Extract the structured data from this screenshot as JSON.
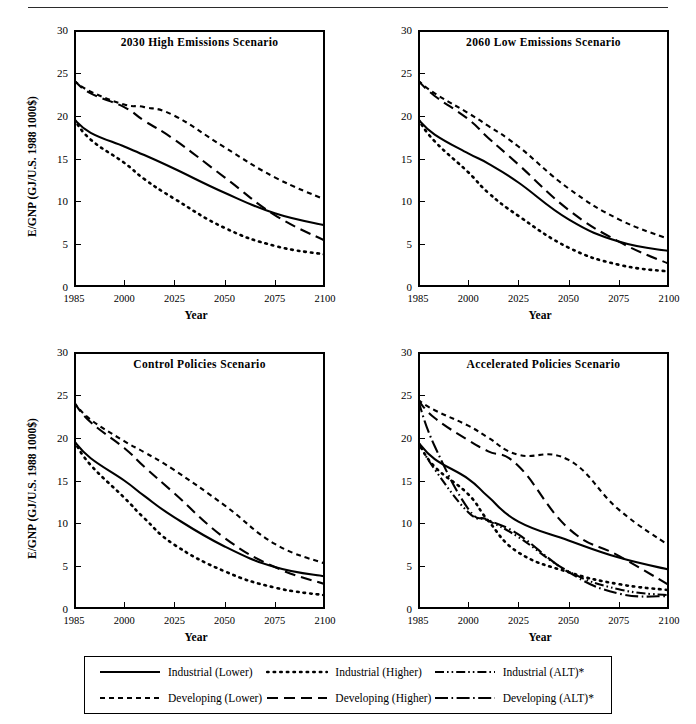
{
  "figure": {
    "header_rule": true,
    "axis": {
      "ylabel": "E/GNP (GJ/U.S. 1988 1000$)",
      "xlabel": "Year",
      "yticks": [
        "30",
        "25",
        "20",
        "15",
        "10",
        "5",
        "0"
      ],
      "xticks": [
        "1985",
        "2000",
        "2025",
        "2050",
        "2075",
        "2100"
      ]
    },
    "legend": {
      "items": [
        {
          "label": "Industrial (Lower)",
          "style": "solid"
        },
        {
          "label": "Industrial (Higher)",
          "style": "dotted"
        },
        {
          "label": "Industrial (ALT)*",
          "style": "dashdotdot"
        },
        {
          "label": "Developing (Lower)",
          "style": "shortdash"
        },
        {
          "label": "Developing (Higher)",
          "style": "longdash"
        },
        {
          "label": "Developing (ALT)*",
          "style": "dashdot"
        }
      ]
    }
  },
  "chart_data": [
    {
      "type": "line",
      "title": "2030 High Emissions Scenario",
      "xlabel": "Year",
      "ylabel": "E/GNP (GJ/U.S. 1988 1000$)",
      "xticks": [
        1985,
        2000,
        2025,
        2050,
        2075,
        2100
      ],
      "ylim": [
        0,
        30
      ],
      "xlim": [
        1985,
        2100
      ],
      "grid": false,
      "series": [
        {
          "name": "Industrial (Lower)",
          "style": "solid",
          "x": [
            1985,
            1990,
            2000,
            2010,
            2025,
            2050,
            2075,
            2100
          ],
          "values": [
            19.6,
            18.0,
            16.4,
            15.4,
            13.8,
            11.0,
            8.6,
            7.2
          ]
        },
        {
          "name": "Industrial (Higher)",
          "style": "dotted",
          "x": [
            1985,
            1990,
            2000,
            2010,
            2025,
            2050,
            2075,
            2100
          ],
          "values": [
            19.6,
            17.2,
            14.5,
            12.6,
            10.3,
            6.9,
            4.8,
            3.8
          ]
        },
        {
          "name": "Developing (Lower)",
          "style": "shortdash",
          "x": [
            1985,
            1990,
            2000,
            2010,
            2025,
            2050,
            2075,
            2100
          ],
          "values": [
            24.1,
            22.8,
            21.3,
            21.0,
            20.0,
            16.3,
            12.8,
            10.2
          ]
        },
        {
          "name": "Developing (Higher)",
          "style": "longdash",
          "x": [
            1985,
            1990,
            2000,
            2010,
            2025,
            2050,
            2075,
            2100
          ],
          "values": [
            24.1,
            22.6,
            21.0,
            19.4,
            17.2,
            12.8,
            8.4,
            5.4
          ]
        }
      ]
    },
    {
      "type": "line",
      "title": "2060 Low Emissions Scenario",
      "xlabel": "Year",
      "ylabel": "E/GNP (GJ/U.S. 1988 1000$)",
      "xticks": [
        1985,
        2000,
        2025,
        2050,
        2075,
        2100
      ],
      "ylim": [
        0,
        30
      ],
      "xlim": [
        1985,
        2100
      ],
      "grid": false,
      "series": [
        {
          "name": "Industrial (Lower)",
          "style": "solid",
          "x": [
            1985,
            1990,
            2000,
            2010,
            2025,
            2050,
            2075,
            2100
          ],
          "values": [
            19.6,
            17.8,
            15.6,
            14.4,
            12.2,
            7.9,
            5.3,
            4.2
          ]
        },
        {
          "name": "Industrial (Higher)",
          "style": "dotted",
          "x": [
            1985,
            1990,
            2000,
            2010,
            2025,
            2050,
            2075,
            2100
          ],
          "values": [
            19.6,
            17.0,
            13.4,
            11.0,
            8.3,
            4.6,
            2.6,
            1.8
          ]
        },
        {
          "name": "Developing (Lower)",
          "style": "shortdash",
          "x": [
            1985,
            1990,
            2000,
            2010,
            2025,
            2050,
            2075,
            2100
          ],
          "values": [
            24.1,
            22.6,
            20.3,
            18.8,
            16.4,
            11.5,
            7.9,
            5.6
          ]
        },
        {
          "name": "Developing (Higher)",
          "style": "longdash",
          "x": [
            1985,
            1990,
            2000,
            2010,
            2025,
            2050,
            2075,
            2100
          ],
          "values": [
            24.1,
            22.3,
            19.6,
            17.4,
            14.3,
            9.0,
            5.3,
            2.7
          ]
        }
      ]
    },
    {
      "type": "line",
      "title": "Control Policies Scenario",
      "xlabel": "Year",
      "ylabel": "E/GNP (GJ/U.S. 1988 1000$)",
      "xticks": [
        1985,
        2000,
        2025,
        2050,
        2075,
        2100
      ],
      "ylim": [
        0,
        30
      ],
      "xlim": [
        1985,
        2100
      ],
      "grid": false,
      "series": [
        {
          "name": "Industrial (Lower)",
          "style": "solid",
          "x": [
            1985,
            1990,
            2000,
            2010,
            2025,
            2050,
            2075,
            2100
          ],
          "values": [
            19.6,
            17.6,
            15.0,
            13.2,
            10.7,
            7.3,
            4.9,
            3.8
          ]
        },
        {
          "name": "Industrial (Higher)",
          "style": "dotted",
          "x": [
            1985,
            1990,
            2000,
            2010,
            2025,
            2050,
            2075,
            2100
          ],
          "values": [
            19.6,
            16.8,
            13.0,
            10.6,
            7.5,
            4.4,
            2.5,
            1.6
          ]
        },
        {
          "name": "Developing (Lower)",
          "style": "shortdash",
          "x": [
            1985,
            1990,
            2000,
            2010,
            2025,
            2050,
            2075,
            2100
          ],
          "values": [
            24.1,
            22.1,
            19.6,
            18.3,
            16.2,
            12.1,
            7.6,
            5.3
          ]
        },
        {
          "name": "Developing (Higher)",
          "style": "longdash",
          "x": [
            1985,
            1990,
            2000,
            2010,
            2025,
            2050,
            2075,
            2100
          ],
          "values": [
            24.1,
            21.8,
            18.8,
            16.6,
            13.5,
            8.3,
            4.9,
            2.9
          ]
        }
      ]
    },
    {
      "type": "line",
      "title": "Accelerated Policies Scenario",
      "xlabel": "Year",
      "ylabel": "E/GNP (GJ/U.S. 1988 1000$)",
      "xticks": [
        1985,
        2000,
        2025,
        2050,
        2075,
        2100
      ],
      "ylim": [
        0,
        30
      ],
      "xlim": [
        1985,
        2100
      ],
      "grid": false,
      "series": [
        {
          "name": "Industrial (Lower)",
          "style": "solid",
          "x": [
            1985,
            1990,
            2000,
            2010,
            2025,
            2050,
            2075,
            2100
          ],
          "values": [
            19.5,
            17.5,
            15.2,
            13.1,
            10.2,
            8.0,
            6.0,
            4.6
          ]
        },
        {
          "name": "Industrial (Higher)",
          "style": "dotted",
          "x": [
            1985,
            1990,
            2000,
            2010,
            2025,
            2050,
            2075,
            2100
          ],
          "values": [
            19.5,
            16.6,
            13.4,
            10.3,
            6.6,
            4.3,
            2.9,
            2.2
          ]
        },
        {
          "name": "Industrial (ALT)*",
          "style": "dashdotdot",
          "x": [
            1985,
            1990,
            2000,
            2010,
            2025,
            2050,
            2075,
            2100
          ],
          "values": [
            19.5,
            16.3,
            11.3,
            10.3,
            8.4,
            4.4,
            2.3,
            1.6
          ]
        },
        {
          "name": "Developing (Lower)",
          "style": "shortdash",
          "x": [
            1985,
            1990,
            2000,
            2010,
            2025,
            2050,
            2075,
            2100
          ],
          "values": [
            24.4,
            23.2,
            21.4,
            20.0,
            18.0,
            17.4,
            11.6,
            7.4
          ]
        },
        {
          "name": "Developing (Higher)",
          "style": "longdash",
          "x": [
            1985,
            1990,
            2000,
            2010,
            2025,
            2050,
            2075,
            2100
          ],
          "values": [
            24.4,
            22.3,
            19.7,
            18.4,
            16.7,
            9.4,
            6.2,
            2.8
          ]
        },
        {
          "name": "Developing (ALT)*",
          "style": "dashdot",
          "x": [
            1985,
            1990,
            2000,
            2010,
            2025,
            2050,
            2075,
            2100
          ],
          "values": [
            24.4,
            19.0,
            11.7,
            10.4,
            8.7,
            4.3,
            1.8,
            1.5
          ]
        }
      ]
    }
  ]
}
